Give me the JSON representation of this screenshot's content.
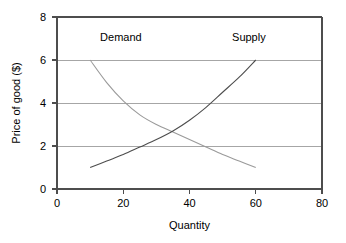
{
  "chart_data": {
    "type": "line",
    "title": "",
    "xlabel": "Quantity",
    "ylabel": "Price of good ($)",
    "xlim": [
      0,
      80
    ],
    "ylim": [
      0,
      8
    ],
    "xticks": [
      "0",
      "20",
      "40",
      "60",
      "80"
    ],
    "yticks": [
      "0",
      "2",
      "4",
      "6",
      "8"
    ],
    "xtick_values": [
      0,
      20,
      40,
      60,
      80
    ],
    "ytick_values": [
      0,
      2,
      4,
      6,
      8
    ],
    "grid": "horizontal",
    "legend_position": "inline-annotations",
    "series": [
      {
        "name": "Demand",
        "color": "#9a9a9a",
        "x": [
          10,
          15,
          20,
          25,
          30,
          35,
          40,
          45,
          50,
          55,
          60
        ],
        "values": [
          6.0,
          4.95,
          4.1,
          3.45,
          3.0,
          2.65,
          2.3,
          1.95,
          1.6,
          1.3,
          1.0
        ]
      },
      {
        "name": "Supply",
        "color": "#4d4d4d",
        "x": [
          10,
          15,
          20,
          25,
          30,
          35,
          40,
          45,
          50,
          55,
          60
        ],
        "values": [
          1.0,
          1.3,
          1.6,
          1.95,
          2.3,
          2.7,
          3.2,
          3.8,
          4.5,
          5.2,
          6.0
        ]
      }
    ],
    "annotations": [
      {
        "text": "Demand",
        "x": 13,
        "y": 6.9
      },
      {
        "text": "Supply",
        "x": 63,
        "y": 6.9
      }
    ],
    "equilibrium": {
      "quantity": 35,
      "price": 2.7
    }
  },
  "colors": {
    "demand": "#9a9a9a",
    "supply": "#4d4d4d",
    "gridline": "#a6a6a6",
    "axis": "#4d4d4d",
    "background": "#ffffff"
  }
}
